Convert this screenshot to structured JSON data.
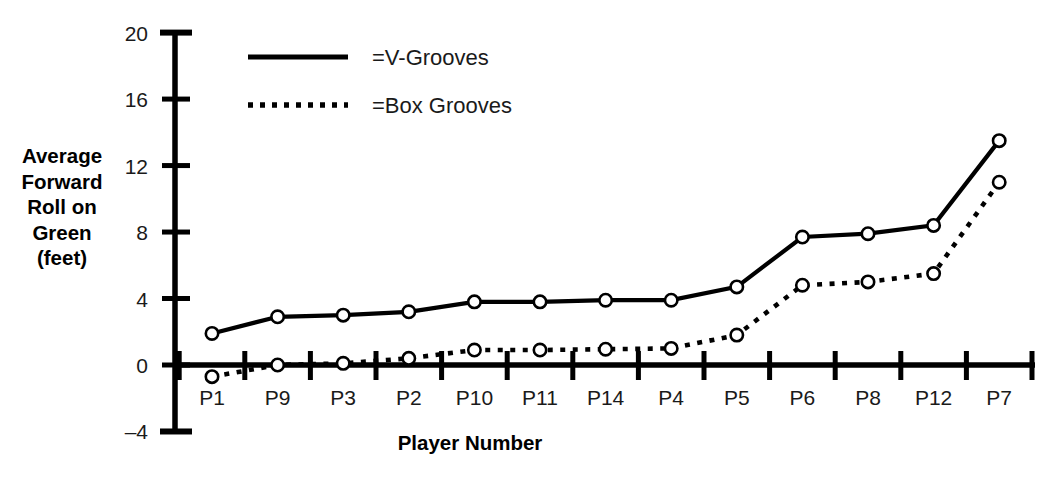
{
  "chart_data": {
    "type": "line",
    "title": "",
    "xlabel": "Player Number",
    "ylabel": "Average Forward Roll on Green (feet)",
    "ylabel_lines": [
      "Average",
      "Forward",
      "Roll on",
      "Green",
      "(feet)"
    ],
    "categories": [
      "P1",
      "P9",
      "P3",
      "P2",
      "P10",
      "P11",
      "P14",
      "P4",
      "P5",
      "P6",
      "P8",
      "P12",
      "P7"
    ],
    "yticks": [
      20,
      16,
      12,
      8,
      4,
      0,
      -4
    ],
    "ytick_labels": [
      "20",
      "16",
      "12",
      "8",
      "4",
      "0",
      "–4"
    ],
    "ylim": [
      -4,
      20
    ],
    "grid": false,
    "legend_position": "top-left-inside",
    "series": [
      {
        "name": "=V-Grooves",
        "style": "solid",
        "marker": "open-circle",
        "color": "#000000",
        "values": [
          1.9,
          2.9,
          3.0,
          3.2,
          3.8,
          3.8,
          3.9,
          3.9,
          4.7,
          7.7,
          7.9,
          8.4,
          13.5
        ]
      },
      {
        "name": "=Box Grooves",
        "style": "dotted",
        "marker": "open-circle",
        "color": "#000000",
        "values": [
          -0.7,
          0.0,
          0.1,
          0.4,
          0.9,
          0.9,
          0.95,
          1.0,
          1.8,
          4.8,
          5.0,
          5.5,
          11.0
        ]
      }
    ],
    "legend": [
      {
        "label": "=V-Grooves",
        "style": "solid"
      },
      {
        "label": "=Box Grooves",
        "style": "dotted"
      }
    ]
  }
}
